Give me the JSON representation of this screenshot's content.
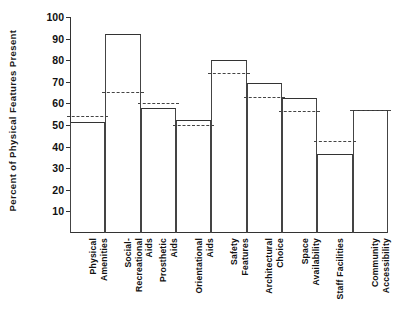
{
  "chart_data": {
    "type": "bar",
    "title": "",
    "xlabel": "",
    "ylabel": "Percent of Physical Features Present",
    "ylim": [
      0,
      100
    ],
    "ytick_labels": [
      "100",
      "90",
      "80",
      "70",
      "60",
      "50",
      "40",
      "30",
      "20",
      "10"
    ],
    "ytick_values": [
      100,
      90,
      80,
      70,
      60,
      50,
      40,
      30,
      20,
      10
    ],
    "grid": false,
    "legend": "none",
    "categories": [
      "Physical Amenities",
      "Social-Recreational Aids",
      "Prosthetic Aids",
      "Orientational Aids",
      "Safety Features",
      "Architectural Choice",
      "Space Availability",
      "Staff Facilities",
      "Community Accessibility"
    ],
    "category_lines": [
      [
        "Physical",
        "Amenities"
      ],
      [
        "Social-",
        "Recreational",
        "Aids"
      ],
      [
        "Prosthetic",
        "Aids"
      ],
      [
        "Orientational",
        "Aids"
      ],
      [
        "Safety",
        "Features"
      ],
      [
        "Architectural",
        "Choice"
      ],
      [
        "Space",
        "Availability"
      ],
      [
        "Staff Facilities"
      ],
      [
        "Community",
        "Accessibility"
      ]
    ],
    "series": [
      {
        "name": "Bar (solid outline)",
        "style": "solid-bar",
        "values": [
          51.5,
          92,
          58,
          52.5,
          80,
          69.5,
          62.5,
          36.5,
          57
        ]
      },
      {
        "name": "Reference (dashed line)",
        "style": "dashed-line",
        "values": [
          54,
          65.5,
          60,
          50,
          74,
          63,
          56.5,
          42.5,
          57
        ]
      }
    ]
  }
}
